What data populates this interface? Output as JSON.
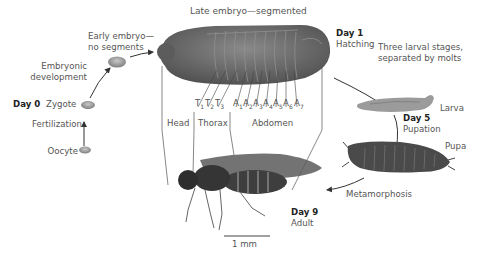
{
  "title": "Late embryo—segmented",
  "stages": {
    "oocyte": "Oocyte",
    "fertilization": "Fertilization",
    "day0": "Day 0",
    "zygote": "Zygote",
    "embryonic_dev_line1": "Embryonic",
    "embryonic_dev_line2": "development",
    "early_embryo_line1": "Early embryo—",
    "early_embryo_line2": "no segments",
    "day1": "Day 1",
    "hatching": "Hatching",
    "larval_line1": "Three larval stages,",
    "larval_line2": "separated by molts",
    "larva": "Larva",
    "day5": "Day 5",
    "pupation": "Pupation",
    "pupa": "Pupa",
    "metamorphosis": "Metamorphosis",
    "day9": "Day 9",
    "adult": "Adult"
  },
  "segments": [
    {
      "letter": "T",
      "num": "1"
    },
    {
      "letter": "T",
      "num": "2"
    },
    {
      "letter": "T",
      "num": "3"
    },
    {
      "letter": "A",
      "num": "1"
    },
    {
      "letter": "A",
      "num": "2"
    },
    {
      "letter": "A",
      "num": "3"
    },
    {
      "letter": "A",
      "num": "4"
    },
    {
      "letter": "A",
      "num": "5"
    },
    {
      "letter": "A",
      "num": "6"
    },
    {
      "letter": "A",
      "num": "7"
    }
  ],
  "regions": {
    "head": "Head",
    "thorax": "Thorax",
    "abdomen": "Abdomen"
  },
  "scale_bar": "1 mm",
  "colors": {
    "embryo": "#6e6e6e",
    "egg": "#9a9a9a",
    "arrow": "#333333",
    "line": "#555555"
  }
}
